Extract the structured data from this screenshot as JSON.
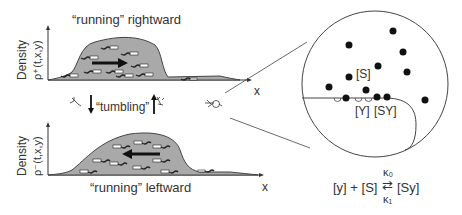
{
  "top_panel": {
    "title": "“running” rightward",
    "ylabel_line1": "Density",
    "ylabel_line2": "ρ⁺(t,x,y)",
    "xlabel": "x",
    "direction": "right"
  },
  "bottom_panel": {
    "title": "“running” leftward",
    "ylabel_line1": "Density",
    "ylabel_line2": "ρ⁻(t,x,y)",
    "xlabel": "x",
    "direction": "left"
  },
  "middle": {
    "tumbling_label": "“tumbling”"
  },
  "zoom_circle": {
    "label_S": "[S]",
    "label_Y": "[Y]",
    "label_SY": "[SY]"
  },
  "equation": {
    "lhs": "[y] + [S]",
    "rhs": "[Sy]",
    "k_forward": "κ₀",
    "k_backward": "κ₁"
  },
  "colors": {
    "fill": "#a9a9a9",
    "stroke": "#333333",
    "dot": "#111111"
  }
}
